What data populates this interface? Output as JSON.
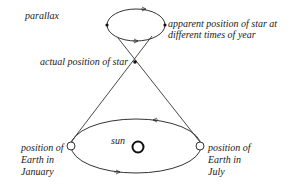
{
  "diagram": {
    "type": "stellar-parallax",
    "labels": {
      "parallax": "parallax",
      "apparent_line1": "apparent position of star at",
      "apparent_line2": "different times of year",
      "actual": "actual position of star",
      "sun": "sun",
      "jan_line1": "position of",
      "jan_line2": "Earth in",
      "jan_line3": "January",
      "jul_line1": "position of",
      "jul_line2": "Earth in",
      "jul_line3": "July"
    },
    "colors": {
      "stroke": "#333333",
      "sun_stroke": "#111111",
      "background": "#ffffff"
    }
  }
}
